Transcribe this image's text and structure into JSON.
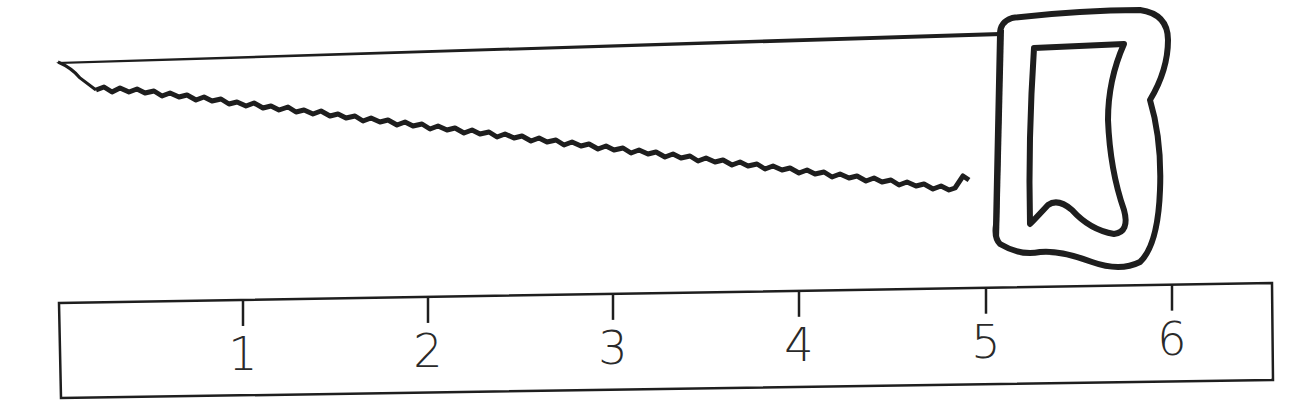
{
  "figure": {
    "object": "saw",
    "object_icon": "saw-icon",
    "instrument": "ruler"
  },
  "ruler": {
    "unit_labels": [
      "1",
      "2",
      "3",
      "4",
      "5",
      "6"
    ],
    "tick_x": [
      243,
      428,
      613,
      799,
      986,
      1172
    ]
  },
  "colors": {
    "stroke": "#1e1e1e",
    "background": "#ffffff"
  }
}
